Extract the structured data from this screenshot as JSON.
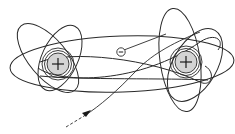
{
  "diagram": {
    "title": "",
    "nuclei": [
      {
        "id": "left",
        "charge_symbol": "+",
        "cx": 58,
        "cy": 64
      },
      {
        "id": "right",
        "charge_symbol": "+",
        "cx": 186,
        "cy": 62
      }
    ],
    "electron": {
      "charge_symbol": "−",
      "cx": 121,
      "cy": 52
    },
    "trajectory": {
      "style": "dashed-then-solid",
      "direction_arrow": true
    },
    "colors": {
      "stroke": "#2a2a2a",
      "nucleus_fill": "#d4d4d4",
      "background": "#ffffff"
    }
  }
}
